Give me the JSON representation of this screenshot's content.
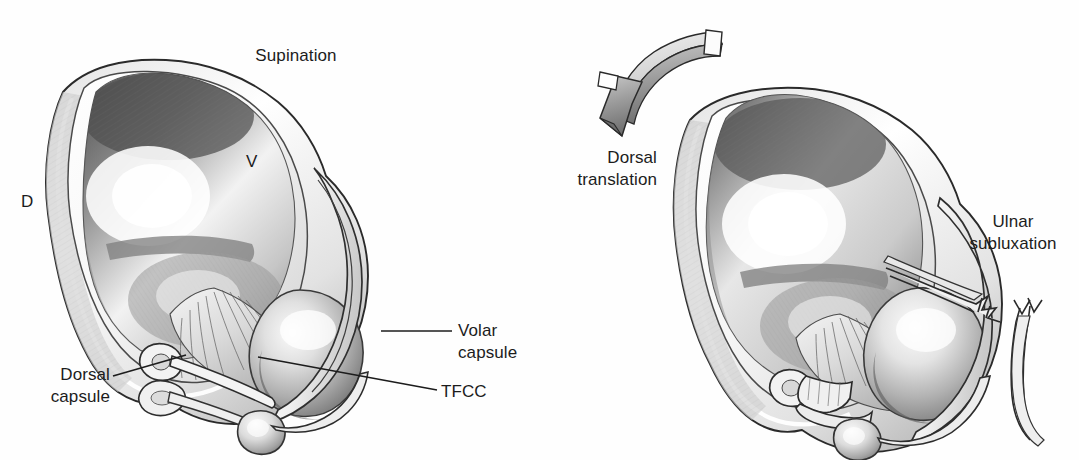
{
  "figure": {
    "kind": "medical-illustration",
    "style": "grayscale pencil / graphite rendering",
    "background_color": "#fefefe",
    "ink_color": "#1c1c1c",
    "width": 1079,
    "height": 460
  },
  "panels": [
    {
      "id": "left-panel",
      "name": "supination-panel",
      "title": "Supination"
    },
    {
      "id": "right-panel",
      "name": "subluxation-panel",
      "title": ""
    }
  ],
  "labels": {
    "supination": "Supination",
    "orientation_dorsal": "D",
    "orientation_volar": "V",
    "volar_capsule": "Volar\ncapsule",
    "tfcc": "TFCC",
    "dorsal_capsule": "Dorsal\ncapsule",
    "dorsal_translation": "Dorsal\ntranslation",
    "ulnar_subluxation": "Ulnar\nsubluxation"
  },
  "leader_lines": [
    {
      "name": "volar-capsule-leader",
      "from": [
        452,
        331
      ],
      "to": [
        381,
        331
      ]
    },
    {
      "name": "tfcc-leader",
      "from": [
        437,
        390
      ],
      "to": [
        258,
        357
      ]
    },
    {
      "name": "dorsal-capsule-leader",
      "from": [
        113,
        376
      ],
      "to": [
        186,
        355
      ]
    }
  ],
  "annotations": {
    "dorsal_translation_arrow": "curved 3D block arrow directed distally-dorsally",
    "tear_marks": "frayed / ruptured capsule edges on the ulnar side of the right panel"
  }
}
